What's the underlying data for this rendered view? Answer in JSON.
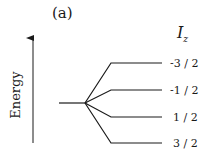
{
  "panel_label": "(a)",
  "axis": {
    "label": "Energy"
  },
  "column_header": {
    "symbol": "I",
    "subscript": "z"
  },
  "levels": [
    {
      "label": "-3 / 2",
      "y": 63
    },
    {
      "label": "-1 / 2",
      "y": 90
    },
    {
      "label": "1 / 2",
      "y": 117
    },
    {
      "label": "3 / 2",
      "y": 143
    }
  ],
  "colors": {
    "line": "#1a1a1a"
  }
}
